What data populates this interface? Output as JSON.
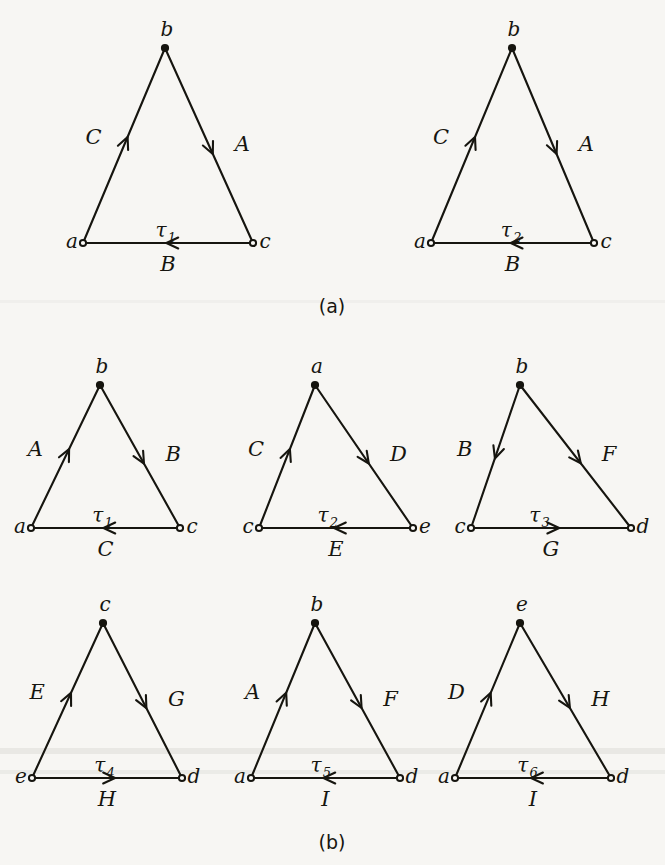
{
  "figure": {
    "background_color": "#f7f6f3",
    "ink_color": "#16150f",
    "panels": [
      {
        "caption": "(a)",
        "caption_x": 332,
        "caption_y": 313,
        "triangles": [
          {
            "face_label": "τ",
            "face_sub": "1",
            "apex": {
              "label": "b",
              "x": 165,
              "y": 48
            },
            "left": {
              "label": "a",
              "x": 83,
              "y": 243
            },
            "right": {
              "label": "c",
              "x": 253,
              "y": 243
            },
            "edges": [
              {
                "label": "C",
                "side": "left",
                "direction": "up"
              },
              {
                "label": "A",
                "side": "right",
                "direction": "down"
              },
              {
                "label": "B",
                "side": "bottom",
                "direction": "left"
              }
            ]
          },
          {
            "face_label": "τ",
            "face_sub": "2",
            "apex": {
              "label": "b",
              "x": 512,
              "y": 48
            },
            "left": {
              "label": "a",
              "x": 431,
              "y": 243
            },
            "right": {
              "label": "c",
              "x": 594,
              "y": 243
            },
            "edges": [
              {
                "label": "C",
                "side": "left",
                "direction": "up"
              },
              {
                "label": "A",
                "side": "right",
                "direction": "down"
              },
              {
                "label": "B",
                "side": "bottom",
                "direction": "left"
              }
            ]
          }
        ]
      },
      {
        "caption": "(b)",
        "caption_x": 332,
        "caption_y": 849,
        "triangles": [
          {
            "face_label": "τ",
            "face_sub": "1",
            "apex": {
              "label": "b",
              "x": 100,
              "y": 385
            },
            "left": {
              "label": "a",
              "x": 31,
              "y": 528
            },
            "right": {
              "label": "c",
              "x": 180,
              "y": 528
            },
            "edges": [
              {
                "label": "A",
                "side": "left",
                "direction": "up"
              },
              {
                "label": "B",
                "side": "right",
                "direction": "down"
              },
              {
                "label": "C",
                "side": "bottom",
                "direction": "left"
              }
            ]
          },
          {
            "face_label": "τ",
            "face_sub": "2",
            "apex": {
              "label": "a",
              "x": 315,
              "y": 385
            },
            "left": {
              "label": "c",
              "x": 259,
              "y": 528
            },
            "right": {
              "label": "e",
              "x": 413,
              "y": 528
            },
            "edges": [
              {
                "label": "C",
                "side": "left",
                "direction": "up"
              },
              {
                "label": "D",
                "side": "right",
                "direction": "down"
              },
              {
                "label": "E",
                "side": "bottom",
                "direction": "left"
              }
            ]
          },
          {
            "face_label": "τ",
            "face_sub": "3",
            "apex": {
              "label": "b",
              "x": 520,
              "y": 385
            },
            "left": {
              "label": "c",
              "x": 471,
              "y": 528
            },
            "right": {
              "label": "d",
              "x": 631,
              "y": 528
            },
            "edges": [
              {
                "label": "B",
                "side": "left",
                "direction": "down"
              },
              {
                "label": "F",
                "side": "right",
                "direction": "down"
              },
              {
                "label": "G",
                "side": "bottom",
                "direction": "right"
              }
            ]
          },
          {
            "face_label": "τ",
            "face_sub": "4",
            "apex": {
              "label": "c",
              "x": 103,
              "y": 623
            },
            "left": {
              "label": "e",
              "x": 32,
              "y": 778
            },
            "right": {
              "label": "d",
              "x": 182,
              "y": 778
            },
            "edges": [
              {
                "label": "E",
                "side": "left",
                "direction": "up"
              },
              {
                "label": "G",
                "side": "right",
                "direction": "down"
              },
              {
                "label": "H",
                "side": "bottom",
                "direction": "right"
              }
            ]
          },
          {
            "face_label": "τ",
            "face_sub": "5",
            "apex": {
              "label": "b",
              "x": 315,
              "y": 623
            },
            "left": {
              "label": "a",
              "x": 251,
              "y": 778
            },
            "right": {
              "label": "d",
              "x": 400,
              "y": 778
            },
            "edges": [
              {
                "label": "A",
                "side": "left",
                "direction": "up"
              },
              {
                "label": "F",
                "side": "right",
                "direction": "down"
              },
              {
                "label": "I",
                "side": "bottom",
                "direction": "left"
              }
            ]
          },
          {
            "face_label": "τ",
            "face_sub": "6",
            "apex": {
              "label": "e",
              "x": 520,
              "y": 623
            },
            "left": {
              "label": "a",
              "x": 455,
              "y": 778
            },
            "right": {
              "label": "d",
              "x": 611,
              "y": 778
            },
            "edges": [
              {
                "label": "D",
                "side": "left",
                "direction": "up"
              },
              {
                "label": "H",
                "side": "right",
                "direction": "down"
              },
              {
                "label": "I",
                "side": "bottom",
                "direction": "left"
              }
            ]
          }
        ]
      }
    ]
  }
}
